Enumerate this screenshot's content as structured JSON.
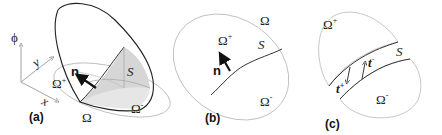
{
  "figure": {
    "panels": [
      {
        "id": "a",
        "label": "(a)",
        "description": "3D level-set function phi over domain Omega, surface S separating Omega+ and Omega-, normal n",
        "axes": {
          "phi": "ϕ",
          "x": "x",
          "y": "y"
        },
        "labels": {
          "omega": "Ω",
          "omega_plus": "Ω",
          "omega_plus_sup": "+",
          "omega_minus": "Ω",
          "omega_minus_sup": "-",
          "surface": "S",
          "normal": "n"
        }
      },
      {
        "id": "b",
        "label": "(b)",
        "description": "2D domain Omega split by interface S into Omega+ and Omega-, normal n",
        "labels": {
          "omega": "Ω",
          "omega_plus": "Ω",
          "omega_plus_sup": "+",
          "omega_minus": "Ω",
          "omega_minus_sup": "-",
          "surface": "S",
          "normal": "n"
        }
      },
      {
        "id": "c",
        "label": "(c)",
        "description": "Domain split apart along S showing tractions t+ and t-",
        "labels": {
          "omega_plus": "Ω",
          "omega_plus_sup": "+",
          "omega_minus": "Ω",
          "omega_minus_sup": "-",
          "surface": "S",
          "t_plus": "t",
          "t_plus_sup": "+",
          "t_minus": "t",
          "t_minus_sup": "-"
        }
      }
    ],
    "colors": {
      "line_dark": "#222222",
      "line_light": "#bfbfbf",
      "shade": "#d9d9d9",
      "shade_light": "#ececec"
    }
  }
}
